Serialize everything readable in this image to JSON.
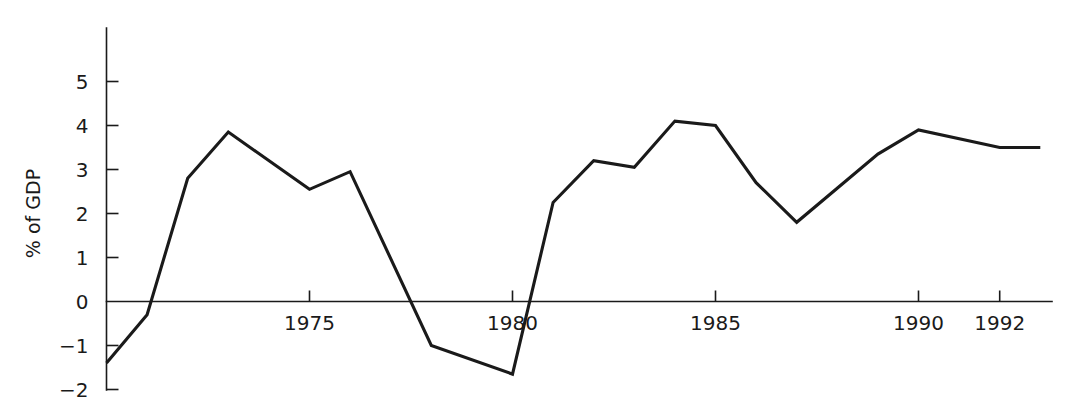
{
  "chart_data": {
    "type": "line",
    "title": "",
    "subtitle": "",
    "xlabel": "",
    "ylabel": "% of GDP",
    "xlim": [
      1970,
      1993
    ],
    "ylim": [
      -2,
      5.8
    ],
    "grid": false,
    "legend": "none",
    "line_color": "#1a1a1a",
    "axis_color": "#1a1a1a",
    "x_tick_labels": [
      "1975",
      "1980",
      "1985",
      "1990",
      "1992"
    ],
    "x_tick_values": [
      1975,
      1980,
      1985,
      1990,
      1992
    ],
    "y_tick_labels": [
      "5",
      "4",
      "3",
      "2",
      "1",
      "0",
      "−1",
      "−2"
    ],
    "y_tick_values": [
      5,
      4,
      3,
      2,
      1,
      0,
      -1,
      -2
    ],
    "x": [
      1970,
      1971,
      1972,
      1973,
      1975,
      1976,
      1978,
      1980,
      1981,
      1982,
      1983,
      1984,
      1985,
      1986,
      1987,
      1989,
      1990,
      1992,
      1993
    ],
    "values": [
      -1.4,
      -0.3,
      2.8,
      3.85,
      2.55,
      2.95,
      -1.0,
      -1.65,
      2.25,
      3.2,
      3.05,
      4.1,
      4.0,
      2.7,
      1.8,
      3.35,
      3.9,
      3.5,
      3.5
    ],
    "series": [
      {
        "name": "% of GDP",
        "values": [
          -1.4,
          -0.3,
          2.8,
          3.85,
          2.55,
          2.95,
          -1.0,
          -1.65,
          2.25,
          3.2,
          3.05,
          4.1,
          4.0,
          2.7,
          1.8,
          3.35,
          3.9,
          3.5,
          3.5
        ]
      }
    ],
    "zero_line": 0
  }
}
